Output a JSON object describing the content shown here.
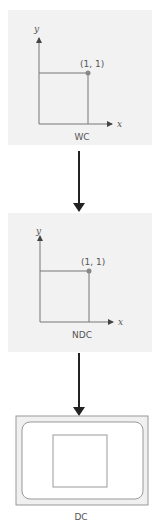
{
  "colors": {
    "panel_bg": "#f2f2f2",
    "line": "#777777",
    "point": "#888888",
    "arrow": "#222222",
    "text": "#555555"
  },
  "panels": [
    {
      "id": "wc",
      "caption": "WC",
      "x_axis_label": "x",
      "y_axis_label": "y",
      "point_label": "(1, 1)"
    },
    {
      "id": "ndc",
      "caption": "NDC",
      "x_axis_label": "x",
      "y_axis_label": "y",
      "point_label": "(1, 1)"
    }
  ],
  "device": {
    "caption": "DC"
  }
}
